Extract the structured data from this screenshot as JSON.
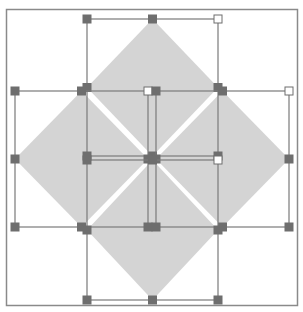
{
  "canvas": {
    "width": 303,
    "height": 312,
    "background": "#ffffff"
  },
  "frame": {
    "x": 6.5,
    "y": 9.5,
    "w": 291,
    "h": 296,
    "stroke": "#8a8a8a",
    "stroke_width": 1.5
  },
  "colors": {
    "diamond_fill": "#d4d4d4",
    "bbox_stroke": "#7a7a7a",
    "handle_fill": "#6e6e6e",
    "handle_hollow_fill": "#ffffff",
    "handle_stroke": "#6e6e6e"
  },
  "handle_size": 8,
  "shapes": [
    {
      "name": "top-diamond",
      "bbox": {
        "x1": 87,
        "y1": 19,
        "x2": 218,
        "y2": 156
      },
      "hollow_handles": [
        "tr"
      ]
    },
    {
      "name": "left-diamond",
      "bbox": {
        "x1": 15,
        "y1": 91,
        "x2": 148,
        "y2": 227
      },
      "hollow_handles": [
        "tr"
      ]
    },
    {
      "name": "right-diamond",
      "bbox": {
        "x1": 156,
        "y1": 91,
        "x2": 289,
        "y2": 227
      },
      "hollow_handles": [
        "tr"
      ]
    },
    {
      "name": "bottom-diamond",
      "bbox": {
        "x1": 87,
        "y1": 160,
        "x2": 218,
        "y2": 300
      },
      "hollow_handles": [
        "tr"
      ]
    }
  ]
}
